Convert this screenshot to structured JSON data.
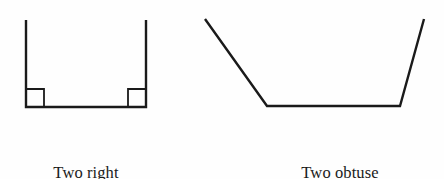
{
  "page": {
    "background_color": "#fefefe",
    "stroke_color": "#1a1a1a",
    "width": 444,
    "height": 179
  },
  "figures": [
    {
      "id": "right-angle-bracket",
      "shape_name": "open-u-shape-bracket",
      "description": "Open bracket with two interior right angles",
      "stroke_color": "#1a1a1a",
      "stroke_width": 2.4,
      "vertices": [
        [
          26,
          20
        ],
        [
          26,
          107
        ],
        [
          146,
          107
        ],
        [
          146,
          20
        ]
      ],
      "angle_markers": [
        {
          "name": "right-angle-marker-left",
          "x": 26,
          "y": 89,
          "size": 18
        },
        {
          "name": "right-angle-marker-right",
          "x": 128,
          "y": 89,
          "size": 18
        }
      ],
      "caption": {
        "line1": "Two right",
        "line2": "angles"
      }
    },
    {
      "id": "obtuse-angle-trapezoid",
      "shape_name": "open-trapezoid",
      "description": "Open trapezoid with two interior obtuse angles",
      "stroke_color": "#1a1a1a",
      "stroke_width": 2.4,
      "vertices": [
        [
          205,
          19
        ],
        [
          267,
          106
        ],
        [
          400,
          106
        ],
        [
          424,
          19
        ]
      ],
      "angle_markers": [],
      "caption": {
        "line1": "Two obtuse",
        "line2": "angles"
      }
    }
  ]
}
